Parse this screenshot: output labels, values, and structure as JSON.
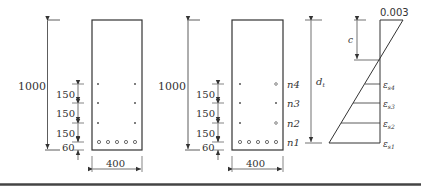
{
  "section1": {
    "height_label": "1000",
    "width_label": "400",
    "spacings": [
      "150",
      "150",
      "150",
      "60"
    ]
  },
  "section2": {
    "height_label": "1000",
    "width_label": "400",
    "spacings": [
      "150",
      "150",
      "150",
      "60"
    ],
    "layer_labels": [
      "n4",
      "n3",
      "n2",
      "n1"
    ]
  },
  "strain": {
    "top_strain": "0.003",
    "c_label": "c",
    "dt_label": "d",
    "dt_sub": "t",
    "eps_symbol": "ε",
    "eps_subs": [
      "s4",
      "s3",
      "s2",
      "s1"
    ]
  }
}
